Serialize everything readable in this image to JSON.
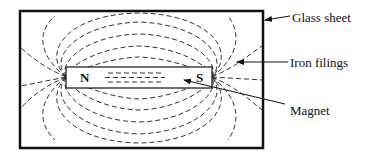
{
  "diagram": {
    "magnet": {
      "north_label": "N",
      "south_label": "S"
    },
    "labels": {
      "glass_sheet": "Glass sheet",
      "iron_filings": "Iron filings",
      "magnet": "Magnet"
    },
    "colors": {
      "stroke": "#111111",
      "background": "#ffffff"
    }
  }
}
